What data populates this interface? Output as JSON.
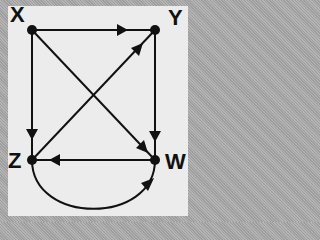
{
  "diagram": {
    "type": "directed-graph",
    "nodes": [
      {
        "id": "X",
        "label": "X"
      },
      {
        "id": "Y",
        "label": "Y"
      },
      {
        "id": "Z",
        "label": "Z"
      },
      {
        "id": "W",
        "label": "W"
      }
    ],
    "edges": [
      {
        "from": "X",
        "to": "Y",
        "shape": "straight"
      },
      {
        "from": "X",
        "to": "Z",
        "shape": "straight"
      },
      {
        "from": "Y",
        "to": "W",
        "shape": "straight"
      },
      {
        "from": "X",
        "to": "W",
        "shape": "straight"
      },
      {
        "from": "Z",
        "to": "Y",
        "shape": "straight"
      },
      {
        "from": "W",
        "to": "Z",
        "shape": "straight"
      },
      {
        "from": "Z",
        "to": "W",
        "shape": "curved-below"
      }
    ],
    "colors": {
      "stroke": "#111111",
      "panel": "#ececec"
    }
  }
}
